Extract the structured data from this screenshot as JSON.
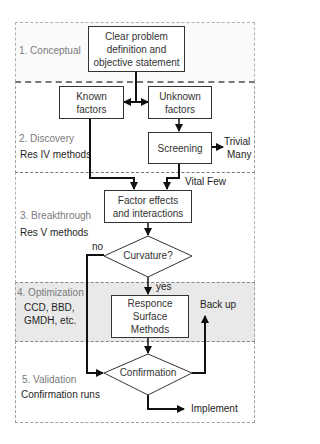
{
  "diagram": {
    "colors": {
      "section_border": "#a0a0a0",
      "section_label": "#7a7a7a",
      "optimization_fill": "#e9e9e9",
      "line": "#111111",
      "box_border": "#333333"
    },
    "sections": [
      {
        "id": "conceptual",
        "label": "1. Conceptual",
        "sub": ""
      },
      {
        "id": "discovery",
        "label": "2. Discovery",
        "sub": "Res IV methods"
      },
      {
        "id": "breakthrough",
        "label": "3. Breakthrough",
        "sub": "Res V methods"
      },
      {
        "id": "optimization",
        "label": "4. Optimization",
        "sub_lines": [
          "CCD, BBD,",
          "GMDH, etc."
        ]
      },
      {
        "id": "validation",
        "label": "5. Validation",
        "sub": "Confirmation runs"
      }
    ],
    "nodes": {
      "problem": {
        "lines": [
          "Clear problem",
          "definition and",
          "objective  statement"
        ]
      },
      "known": {
        "lines": [
          "Known",
          "factors"
        ]
      },
      "unknown": {
        "lines": [
          "Unknown",
          "factors"
        ]
      },
      "screening": {
        "lines": [
          "Screening"
        ]
      },
      "factor_effects": {
        "lines": [
          "Factor effects",
          "and interactions"
        ]
      },
      "curvature": {
        "label": "Curvature?"
      },
      "rsm": {
        "lines": [
          "Responce",
          "Surface",
          "Methods"
        ]
      },
      "confirmation": {
        "label": "Confirmation"
      }
    },
    "edge_labels": {
      "trivial_many": [
        "Trivial",
        "Many"
      ],
      "vital_few": "Vital Few",
      "no": "no",
      "yes": "yes",
      "back_up": "Back up",
      "implement": "Implement"
    }
  }
}
